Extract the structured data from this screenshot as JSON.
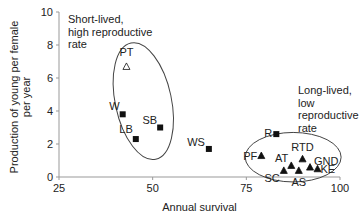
{
  "chart_data": {
    "type": "scatter",
    "title": "",
    "xlabel": "Annual survival",
    "ylabel": "Production of young per female per year",
    "ylabel_lines": [
      "Production of young per female",
      "per year"
    ],
    "xlim": [
      25,
      100
    ],
    "ylim": [
      0,
      10
    ],
    "xticks": [
      25,
      50,
      75,
      100
    ],
    "yticks": [
      0,
      2,
      4,
      6,
      8,
      10
    ],
    "grid": false,
    "series": [
      {
        "name": "squares",
        "marker": "filled-square",
        "points": [
          {
            "label": "W",
            "x": 42,
            "y": 3.8
          },
          {
            "label": "LB",
            "x": 45.5,
            "y": 2.3
          },
          {
            "label": "SB",
            "x": 52,
            "y": 3.0
          },
          {
            "label": "WS",
            "x": 65,
            "y": 1.7
          },
          {
            "label": "R",
            "x": 83,
            "y": 2.6
          }
        ]
      },
      {
        "name": "open-triangles",
        "marker": "open-triangle",
        "points": [
          {
            "label": "PT",
            "x": 43,
            "y": 6.7
          }
        ]
      },
      {
        "name": "filled-triangles",
        "marker": "filled-triangle",
        "points": [
          {
            "label": "PF",
            "x": 79,
            "y": 1.3
          },
          {
            "label": "SC",
            "x": 85,
            "y": 0.4
          },
          {
            "label": "AT",
            "x": 87,
            "y": 0.7
          },
          {
            "label": "AS",
            "x": 89,
            "y": 0.4
          },
          {
            "label": "RTD",
            "x": 90,
            "y": 1.1
          },
          {
            "label": "GND",
            "x": 92,
            "y": 0.6
          },
          {
            "label": "KE",
            "x": 94,
            "y": 0.5
          }
        ]
      }
    ],
    "annotations": [
      {
        "text_lines": [
          "Short-lived,",
          "high reproductive",
          "rate"
        ],
        "group": "short-lived"
      },
      {
        "text_lines": [
          "Long-lived,",
          "low",
          "reproductive",
          "rate"
        ],
        "group": "long-lived"
      }
    ],
    "ellipses": [
      {
        "group": "short-lived",
        "cx": 47.5,
        "cy": 4.6,
        "rx_units": 7.5,
        "ry_units": 3.6,
        "rotation_deg": -12
      },
      {
        "group": "long-lived",
        "cx": 87.5,
        "cy": 1.2,
        "rx_units": 12.8,
        "ry_units": 1.5,
        "rotation_deg": 0
      }
    ]
  }
}
